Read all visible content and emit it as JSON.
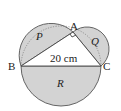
{
  "figure": {
    "vertices": {
      "a": "A",
      "b": "B",
      "c": "C"
    },
    "regions": {
      "p": "P",
      "q": "Q",
      "r": "R"
    },
    "side_label": "20 cm",
    "right_angle_at": "A",
    "shade_color": "#d3d3d3"
  }
}
